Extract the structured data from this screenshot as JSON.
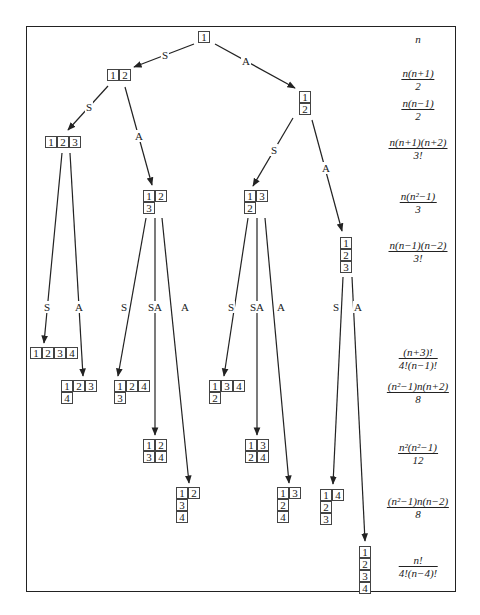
{
  "diagram": {
    "tableaux": [
      {
        "id": "t1",
        "x": 198,
        "y": 31,
        "rows": [
          [
            "1"
          ]
        ]
      },
      {
        "id": "t12",
        "x": 107,
        "y": 69,
        "rows": [
          [
            "1",
            "2"
          ]
        ]
      },
      {
        "id": "t1_2",
        "x": 299,
        "y": 91,
        "rows": [
          [
            "1"
          ],
          [
            "2"
          ]
        ]
      },
      {
        "id": "t123",
        "x": 45,
        "y": 136,
        "rows": [
          [
            "1",
            "2",
            "3"
          ]
        ]
      },
      {
        "id": "t12_3",
        "x": 143,
        "y": 190,
        "rows": [
          [
            "1",
            "2"
          ],
          [
            "3"
          ]
        ]
      },
      {
        "id": "t13_2",
        "x": 244,
        "y": 190,
        "rows": [
          [
            "1",
            "3"
          ],
          [
            "2"
          ]
        ]
      },
      {
        "id": "t1_2_3",
        "x": 340,
        "y": 237,
        "rows": [
          [
            "1"
          ],
          [
            "2"
          ],
          [
            "3"
          ]
        ]
      },
      {
        "id": "t1234",
        "x": 30,
        "y": 347,
        "rows": [
          [
            "1",
            "2",
            "3",
            "4"
          ]
        ]
      },
      {
        "id": "t123_4",
        "x": 61,
        "y": 380,
        "rows": [
          [
            "1",
            "2",
            "3"
          ],
          [
            "4"
          ]
        ]
      },
      {
        "id": "t124_3",
        "x": 114,
        "y": 380,
        "rows": [
          [
            "1",
            "2",
            "4"
          ],
          [
            "3"
          ]
        ]
      },
      {
        "id": "t134_2",
        "x": 209,
        "y": 380,
        "rows": [
          [
            "1",
            "3",
            "4"
          ],
          [
            "2"
          ]
        ]
      },
      {
        "id": "t12_34",
        "x": 143,
        "y": 439,
        "rows": [
          [
            "1",
            "2"
          ],
          [
            "3",
            "4"
          ]
        ]
      },
      {
        "id": "t13_24",
        "x": 245,
        "y": 439,
        "rows": [
          [
            "1",
            "3"
          ],
          [
            "2",
            "4"
          ]
        ]
      },
      {
        "id": "t12_3_4",
        "x": 176,
        "y": 487,
        "rows": [
          [
            "1",
            "2"
          ],
          [
            "3"
          ],
          [
            "4"
          ]
        ]
      },
      {
        "id": "t13_2_4",
        "x": 277,
        "y": 487,
        "rows": [
          [
            "1",
            "3"
          ],
          [
            "2"
          ],
          [
            "4"
          ]
        ]
      },
      {
        "id": "t14_2_3",
        "x": 320,
        "y": 489,
        "rows": [
          [
            "1",
            "4"
          ],
          [
            "2"
          ],
          [
            "3"
          ]
        ]
      },
      {
        "id": "t1_2_3_4",
        "x": 359,
        "y": 546,
        "rows": [
          [
            "1"
          ],
          [
            "2"
          ],
          [
            "3"
          ],
          [
            "4"
          ]
        ]
      }
    ],
    "edges": [
      {
        "from": [
          194,
          44
        ],
        "to": [
          134,
          67
        ],
        "label": "S",
        "lx": 165,
        "ly": 55
      },
      {
        "from": [
          215,
          44
        ],
        "to": [
          295,
          88
        ],
        "label": "A",
        "lx": 246,
        "ly": 61
      },
      {
        "from": [
          108,
          86
        ],
        "to": [
          68,
          130
        ],
        "label": "S",
        "lx": 89,
        "ly": 107
      },
      {
        "from": [
          125,
          87
        ],
        "to": [
          152,
          185
        ],
        "label": "A",
        "lx": 139,
        "ly": 136
      },
      {
        "from": [
          293,
          118
        ],
        "to": [
          253,
          186
        ],
        "label": "S",
        "lx": 274,
        "ly": 150
      },
      {
        "from": [
          312,
          120
        ],
        "to": [
          342,
          231
        ],
        "label": "A",
        "lx": 326,
        "ly": 168
      },
      {
        "from": [
          62,
          153
        ],
        "to": [
          44,
          343
        ],
        "label": "S",
        "lx": 47,
        "ly": 307
      },
      {
        "from": [
          70,
          153
        ],
        "to": [
          83,
          376
        ],
        "label": "A",
        "lx": 79,
        "ly": 307
      },
      {
        "from": [
          146,
          218
        ],
        "to": [
          118,
          376
        ],
        "label": "S",
        "lx": 124,
        "ly": 307
      },
      {
        "from": [
          155,
          218
        ],
        "to": [
          155,
          435
        ],
        "label": "SA",
        "lx": 155,
        "ly": 307
      },
      {
        "from": [
          162,
          218
        ],
        "to": [
          189,
          483
        ],
        "label": "A",
        "lx": 185,
        "ly": 307
      },
      {
        "from": [
          248,
          218
        ],
        "to": [
          224,
          376
        ],
        "label": "S",
        "lx": 231,
        "ly": 307
      },
      {
        "from": [
          257,
          218
        ],
        "to": [
          257,
          435
        ],
        "label": "SA",
        "lx": 257,
        "ly": 307
      },
      {
        "from": [
          265,
          218
        ],
        "to": [
          289,
          483
        ],
        "label": "A",
        "lx": 281,
        "ly": 307
      },
      {
        "from": [
          343,
          277
        ],
        "to": [
          333,
          484
        ],
        "label": "S",
        "lx": 336,
        "ly": 307
      },
      {
        "from": [
          352,
          277
        ],
        "to": [
          365,
          541
        ],
        "label": "A",
        "lx": 358,
        "ly": 307
      }
    ],
    "dimensions": [
      {
        "y": 33,
        "num": "n",
        "den": ""
      },
      {
        "y": 67,
        "num": "n(n+1)",
        "den": "2"
      },
      {
        "y": 97,
        "num": "n(n−1)",
        "den": "2"
      },
      {
        "y": 136,
        "num": "n(n+1)(n+2)",
        "den": "3!"
      },
      {
        "y": 190,
        "num": "n(n²−1)",
        "den": "3"
      },
      {
        "y": 239,
        "num": "n(n−1)(n−2)",
        "den": "3!"
      },
      {
        "y": 346,
        "num": "(n+3)!",
        "den": "4!(n−1)!"
      },
      {
        "y": 380,
        "num": "(n²−1)n(n+2)",
        "den": "8"
      },
      {
        "y": 441,
        "num": "n²(n²−1)",
        "den": "12"
      },
      {
        "y": 495,
        "num": "(n²−1)n(n−2)",
        "den": "8"
      },
      {
        "y": 554,
        "num": "n!",
        "den": "4!(n−4)!"
      }
    ],
    "dimension_column_x": 418,
    "colors": {
      "line": "#222222",
      "cell_border": "#444444",
      "background": "#ffffff"
    }
  }
}
